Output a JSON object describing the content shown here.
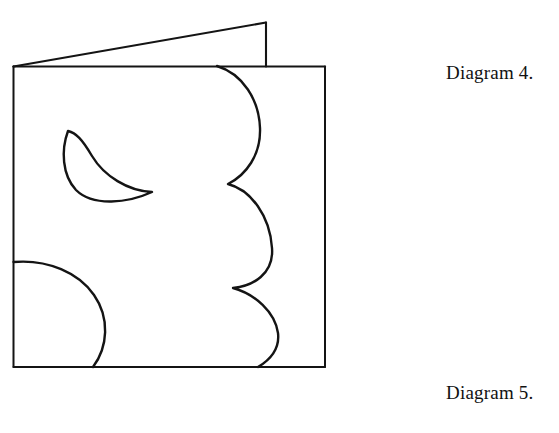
{
  "figure": {
    "background_color": "#ffffff",
    "ink_color": "#141414",
    "captions": [
      {
        "id": "diagram-4",
        "text": "Diagram 4."
      },
      {
        "id": "diagram-5",
        "text": "Diagram 5."
      }
    ],
    "shapes": {
      "flap_triangle": {
        "name": "folded-flap-triangle",
        "description": "slanted flap above the card, rising left to right",
        "points": "13,66 266,22 266,66"
      },
      "card_rectangle": {
        "name": "card-outline",
        "x": 13,
        "y": 66,
        "width": 312,
        "height": 301
      },
      "crescent": {
        "name": "crescent-cutout",
        "tip_upper": "68,131",
        "tip_lower_right": "152,192"
      },
      "scalloped_edge": {
        "name": "scalloped-cut-edge",
        "lobes": 3,
        "start": "217,66",
        "cusp_1": "228,184",
        "cusp_2": "233,288",
        "end": "258,367"
      },
      "half_circle": {
        "name": "half-circle-cutout",
        "start": "13,262",
        "apex": "105,325",
        "end": "93,367"
      }
    }
  }
}
